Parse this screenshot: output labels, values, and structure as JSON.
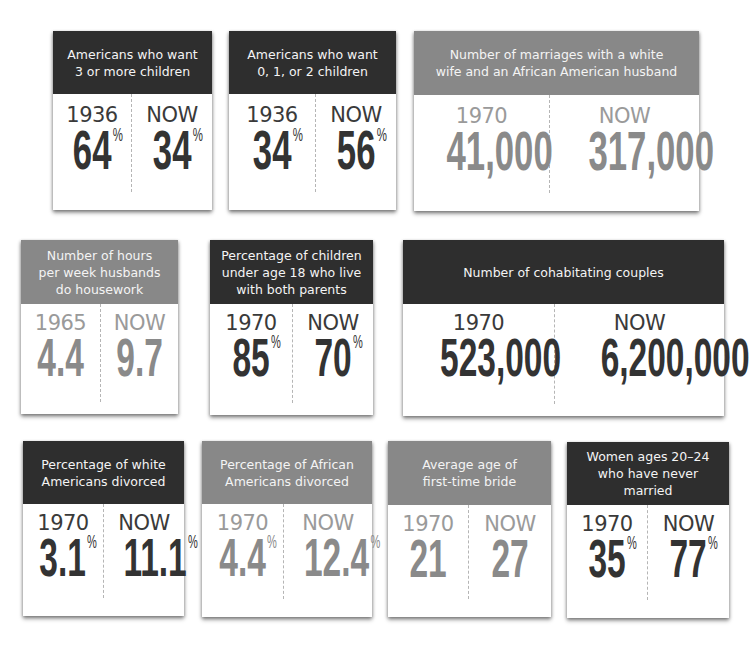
{
  "colors": {
    "header_dark": "#2e2e2e",
    "header_gray": "#888888",
    "number_dark": "#333333",
    "number_gray": "#8a8a8a"
  },
  "cards": [
    {
      "title": "Americans who want 3 or more children",
      "title_lines": [
        "Americans who want",
        "3 or more children"
      ],
      "theme": "dark",
      "left": {
        "label": "1936",
        "value": "64",
        "unit": "%"
      },
      "right": {
        "label": "NOW",
        "value": "34",
        "unit": "%"
      }
    },
    {
      "title": "Americans who want 0, 1, or 2 children",
      "title_lines": [
        "Americans who want",
        "0, 1, or 2 children"
      ],
      "theme": "dark",
      "left": {
        "label": "1936",
        "value": "34",
        "unit": "%"
      },
      "right": {
        "label": "NOW",
        "value": "56",
        "unit": "%"
      }
    },
    {
      "title": "Number of marriages with a white wife and an African American husband",
      "title_lines": [
        "Number of marriages with a white",
        "wife and an African American husband"
      ],
      "theme": "gray",
      "left": {
        "label": "1970",
        "value": "41,000",
        "unit": ""
      },
      "right": {
        "label": "NOW",
        "value": "317,000",
        "unit": ""
      }
    },
    {
      "title": "Number of hours per week husbands do housework",
      "title_lines": [
        "Number of hours",
        "per week husbands",
        "do housework"
      ],
      "theme": "gray",
      "left": {
        "label": "1965",
        "value": "4.4",
        "unit": ""
      },
      "right": {
        "label": "NOW",
        "value": "9.7",
        "unit": ""
      }
    },
    {
      "title": "Percentage of children under age 18 who live with both parents",
      "title_lines": [
        "Percentage of children",
        "under age 18 who live",
        "with both parents"
      ],
      "theme": "dark",
      "left": {
        "label": "1970",
        "value": "85",
        "unit": "%"
      },
      "right": {
        "label": "NOW",
        "value": "70",
        "unit": "%"
      }
    },
    {
      "title": "Number of cohabitating couples",
      "title_lines": [
        "Number of cohabitating couples"
      ],
      "theme": "dark",
      "left": {
        "label": "1970",
        "value": "523,000",
        "unit": ""
      },
      "right": {
        "label": "NOW",
        "value": "6,200,000",
        "unit": ""
      }
    },
    {
      "title": "Percentage of white Americans divorced",
      "title_lines": [
        "Percentage of white",
        "Americans divorced"
      ],
      "theme": "dark",
      "left": {
        "label": "1970",
        "value": "3.1",
        "unit": "%"
      },
      "right": {
        "label": "NOW",
        "value": "11.1",
        "unit": "%"
      }
    },
    {
      "title": "Percentage of African Americans divorced",
      "title_lines": [
        "Percentage of African",
        "Americans divorced"
      ],
      "theme": "gray",
      "left": {
        "label": "1970",
        "value": "4.4",
        "unit": "%"
      },
      "right": {
        "label": "NOW",
        "value": "12.4",
        "unit": "%"
      }
    },
    {
      "title": "Average age of first-time bride",
      "title_lines": [
        "Average age of",
        "first-time bride"
      ],
      "theme": "gray",
      "left": {
        "label": "1970",
        "value": "21",
        "unit": ""
      },
      "right": {
        "label": "NOW",
        "value": "27",
        "unit": ""
      }
    },
    {
      "title": "Women ages 20–24 who have never married",
      "title_lines": [
        "Women ages 20–24",
        "who have never married"
      ],
      "theme": "dark",
      "left": {
        "label": "1970",
        "value": "35",
        "unit": "%"
      },
      "right": {
        "label": "NOW",
        "value": "77",
        "unit": "%"
      }
    }
  ]
}
